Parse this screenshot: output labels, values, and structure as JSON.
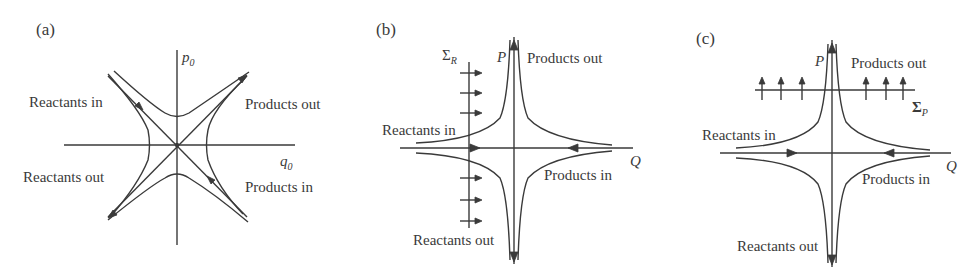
{
  "figure": {
    "panels": [
      {
        "id": "a",
        "letter": "(a)",
        "axes": {
          "x_label": "q",
          "x_sub": "0",
          "y_label": "p",
          "y_sub": "0"
        },
        "labels": {
          "top_left": "Reactants in",
          "top_right": "Products out",
          "bottom_left": "Reactants out",
          "bottom_right": "Products in"
        }
      },
      {
        "id": "b",
        "letter": "(b)",
        "axes": {
          "x_label": "Q",
          "y_label": "P"
        },
        "surface": {
          "symbol": "Σ",
          "sub": "R",
          "orientation": "vertical",
          "arrow_direction": "right"
        },
        "labels": {
          "top_right": "Products out",
          "left": "Reactants in",
          "right": "Products in",
          "bottom": "Reactants out"
        }
      },
      {
        "id": "c",
        "letter": "(c)",
        "axes": {
          "x_label": "Q",
          "y_label": "P"
        },
        "surface": {
          "symbol": "Σ",
          "sub": "P",
          "orientation": "horizontal",
          "arrow_direction": "up"
        },
        "labels": {
          "top_right": "Products out",
          "left": "Reactants in",
          "right": "Products in",
          "bottom": "Reactants out"
        }
      }
    ],
    "line_color": "#3a3a3a",
    "background": "#ffffff"
  }
}
